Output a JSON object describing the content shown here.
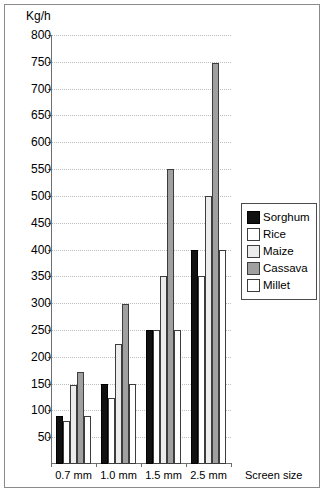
{
  "chart_data": {
    "type": "bar",
    "title": "",
    "subtitle": "",
    "xlabel": "Screen size",
    "ylabel": "Kg/h",
    "ylim": [
      0,
      800
    ],
    "ytick_step": 50,
    "yticks": [
      800,
      750,
      700,
      650,
      600,
      550,
      500,
      450,
      400,
      350,
      300,
      250,
      200,
      150,
      100,
      50
    ],
    "grid": "horizontal-dotted",
    "legend_position": "right-middle",
    "categories": [
      "0.7 mm",
      "1.0 mm",
      "1.5 mm",
      "2.5 mm"
    ],
    "series": [
      {
        "name": "Sorghum",
        "color": "#111111",
        "values": [
          90,
          150,
          250,
          400
        ]
      },
      {
        "name": "Rice",
        "color": "#ffffff",
        "values": [
          80,
          123,
          250,
          350
        ]
      },
      {
        "name": "Maize",
        "color": "#ececec",
        "values": [
          148,
          223,
          350,
          500
        ]
      },
      {
        "name": "Cassava",
        "color": "#a0a0a0",
        "values": [
          172,
          298,
          550,
          748
        ]
      },
      {
        "name": "Millet",
        "color": "#ffffff",
        "values": [
          90,
          150,
          250,
          400
        ]
      }
    ]
  },
  "legend": {
    "items": [
      {
        "label": "Sorghum"
      },
      {
        "label": "Rice"
      },
      {
        "label": "Maize"
      },
      {
        "label": "Cassava"
      },
      {
        "label": "Millet"
      }
    ]
  },
  "axes": {
    "y_unit_label": "Kg/h",
    "x_axis_title": "Screen size"
  }
}
